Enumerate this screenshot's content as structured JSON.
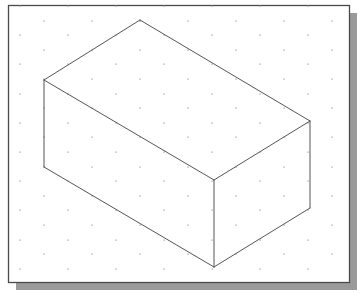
{
  "figure": {
    "width": 361,
    "height": 294
  },
  "frame": {
    "x": 8,
    "y": 5,
    "width": 341,
    "height": 277,
    "border_color": "#4a4a4a",
    "shadow_color": "#9a9a9a",
    "shadow_offset": 8
  },
  "grid": {
    "type": "isometric-dots",
    "dot_color": "#9a9a9a",
    "x_spacing": 48,
    "row_spacing": 14.6,
    "first_row_y": 6,
    "even_row_x0": 20,
    "odd_row_x0": 44
  },
  "box": {
    "line_color": "#555555",
    "vertices": {
      "top_back": [
        140,
        20
      ],
      "top_left": [
        44,
        80
      ],
      "top_right": [
        310,
        121
      ],
      "top_front": [
        214,
        180
      ],
      "bottom_left": [
        44,
        167
      ],
      "bottom_right": [
        310,
        208
      ],
      "bottom_front": [
        214,
        267
      ]
    },
    "edges": [
      [
        "top_back",
        "top_left"
      ],
      [
        "top_back",
        "top_right"
      ],
      [
        "top_left",
        "top_front"
      ],
      [
        "top_right",
        "top_front"
      ],
      [
        "top_left",
        "bottom_left"
      ],
      [
        "top_right",
        "bottom_right"
      ],
      [
        "top_front",
        "bottom_front"
      ],
      [
        "bottom_left",
        "bottom_front"
      ],
      [
        "bottom_right",
        "bottom_front"
      ]
    ]
  }
}
